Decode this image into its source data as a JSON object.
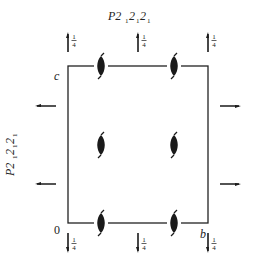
{
  "diagram": {
    "title_parts": {
      "base": "P2",
      "sub1": "1",
      "mid1": "2",
      "sub2": "1",
      "mid2": "2",
      "sub3": "1"
    },
    "side_title": "P2₁2₁2₁",
    "axis_labels": {
      "origin": "0",
      "b": "b",
      "c": "c"
    },
    "frame": {
      "x0": 68,
      "y0": 66,
      "x1": 208,
      "y1": 223,
      "color": "#222222"
    },
    "screw_axes_on_edges": [
      {
        "x": 101,
        "y": 66
      },
      {
        "x": 174,
        "y": 66
      },
      {
        "x": 101,
        "y": 223
      },
      {
        "x": 174,
        "y": 223
      }
    ],
    "screw_axes_interior": [
      {
        "x": 101,
        "y": 145
      },
      {
        "x": 174,
        "y": 145
      }
    ],
    "height_label": "1/4",
    "top_arrows": [
      {
        "x": 68,
        "label": "¼"
      },
      {
        "x": 138,
        "label": "¼"
      },
      {
        "x": 208,
        "label": "¼"
      }
    ],
    "bottom_arrows": [
      {
        "x": 68,
        "label": "¼"
      },
      {
        "x": 138,
        "label": "¼"
      },
      {
        "x": 208,
        "label": "¼"
      }
    ],
    "left_arrows": [
      {
        "y": 106
      },
      {
        "y": 184
      }
    ],
    "right_arrows": [
      {
        "y": 106
      },
      {
        "y": 184
      }
    ],
    "ink_color": "#1a1a1a"
  }
}
